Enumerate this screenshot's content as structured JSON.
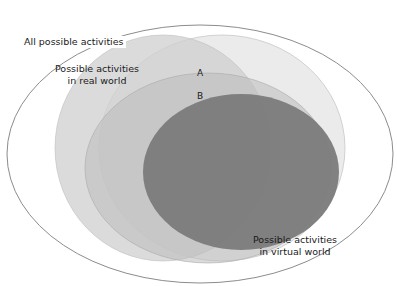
{
  "diagram": {
    "type": "venn",
    "regions": [
      {
        "id": "all",
        "label": "All possible activities",
        "fill": "#ffffff",
        "stroke": "#8a8a8a"
      },
      {
        "id": "real",
        "label_line1": "Possible activities",
        "label_line2": "in real world",
        "fill": "#d2d2d2"
      },
      {
        "id": "virtual",
        "label_line1": "Possible activities",
        "label_line2": "in virtual world",
        "fill": "#e8e8e8"
      },
      {
        "id": "middle",
        "fill": "#b4b4b4"
      },
      {
        "id": "core",
        "fill": "#7b7b7b"
      }
    ],
    "points": [
      {
        "id": "A",
        "label": "A"
      },
      {
        "id": "B",
        "label": "B"
      }
    ]
  },
  "labels": {
    "all": "All possible activities",
    "real_line1": "Possible activities",
    "real_line2": "in real world",
    "virtual_line1": "Possible activities",
    "virtual_line2": "in virtual world",
    "point_a": "A",
    "point_b": "B"
  }
}
